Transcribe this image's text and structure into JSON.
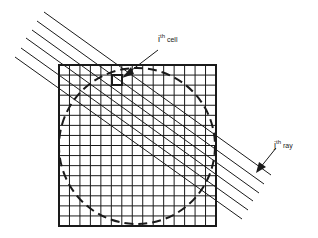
{
  "figure": {
    "type": "tomography-ray-grid",
    "labels": {
      "cell": {
        "base": "i",
        "superscript": "th",
        "suffix": "cell"
      },
      "ray": {
        "base": "j",
        "superscript": "th",
        "suffix": "ray"
      }
    },
    "grid": {
      "x": 59,
      "y": 65,
      "width": 157,
      "height": 161,
      "cols": 15,
      "rows": 16
    },
    "circle": {
      "cx": 137,
      "cy": 146,
      "r": 78,
      "style": "dashed"
    },
    "highlighted_cell": {
      "x": 112,
      "y": 75,
      "width": 10,
      "height": 10
    },
    "rays": [
      {
        "x1": 44,
        "y1": 12,
        "x2": 271,
        "y2": 175
      },
      {
        "x1": 37,
        "y1": 21,
        "x2": 264,
        "y2": 184
      },
      {
        "x1": 32,
        "y1": 30,
        "x2": 259,
        "y2": 193
      },
      {
        "x1": 26,
        "y1": 38,
        "x2": 253,
        "y2": 201
      },
      {
        "x1": 21,
        "y1": 48,
        "x2": 248,
        "y2": 210
      },
      {
        "x1": 15,
        "y1": 57,
        "x2": 242,
        "y2": 219
      }
    ],
    "colors": {
      "ink": "#1a1a1a",
      "background": "#ffffff"
    }
  }
}
